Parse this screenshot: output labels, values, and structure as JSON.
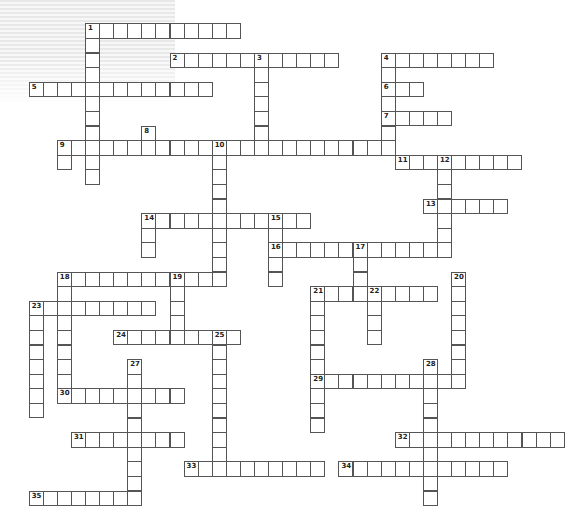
{
  "puzzle": {
    "type": "crossword",
    "grid_origin": {
      "x": 85,
      "y": 23.3
    },
    "cell_w": 14.08,
    "cell_h": 14.6,
    "colors": {
      "border": "#555555",
      "cell": "#ffffff",
      "number": "#222222"
    }
  },
  "across": [
    {
      "num": 1,
      "row": 0,
      "col": 0,
      "len": 11
    },
    {
      "num": 2,
      "row": 2,
      "col": 6,
      "len": 12
    },
    {
      "num": 4,
      "row": 2,
      "col": 21,
      "len": 8
    },
    {
      "num": 5,
      "row": 4,
      "col": -4,
      "len": 13
    },
    {
      "num": 6,
      "row": 4,
      "col": 21,
      "len": 3
    },
    {
      "num": 7,
      "row": 6,
      "col": 21,
      "len": 5
    },
    {
      "num": 9,
      "row": 8,
      "col": -2,
      "len": 24
    },
    {
      "num": 11,
      "row": 9,
      "col": 22,
      "len": 9
    },
    {
      "num": 13,
      "row": 12,
      "col": 24,
      "len": 6
    },
    {
      "num": 14,
      "row": 13,
      "col": 4,
      "len": 12
    },
    {
      "num": 16,
      "row": 15,
      "col": 13,
      "len": 13
    },
    {
      "num": 18,
      "row": 17,
      "col": -2,
      "len": 12
    },
    {
      "num": 21,
      "row": 18,
      "col": 16,
      "len": 9
    },
    {
      "num": 23,
      "row": 19,
      "col": -4,
      "len": 9
    },
    {
      "num": 24,
      "row": 21,
      "col": 2,
      "len": 9
    },
    {
      "num": 29,
      "row": 24,
      "col": 16,
      "len": 11
    },
    {
      "num": 30,
      "row": 25,
      "col": -2,
      "len": 9
    },
    {
      "num": 31,
      "row": 28,
      "col": -1,
      "len": 8
    },
    {
      "num": 32,
      "row": 28,
      "col": 22,
      "len": 12
    },
    {
      "num": 33,
      "row": 30,
      "col": 7,
      "len": 10
    },
    {
      "num": 34,
      "row": 30,
      "col": 18,
      "len": 12
    },
    {
      "num": 35,
      "row": 32,
      "col": -4,
      "len": 8
    }
  ],
  "down": [
    {
      "num": 1,
      "row": 0,
      "col": 0,
      "len": 11
    },
    {
      "num": 3,
      "row": 2,
      "col": 12,
      "len": 7
    },
    {
      "num": 4,
      "row": 2,
      "col": 21,
      "len": 7
    },
    {
      "num": 8,
      "row": 7,
      "col": 4,
      "len": 2
    },
    {
      "num": 9,
      "row": 8,
      "col": -2,
      "len": 2
    },
    {
      "num": 10,
      "row": 8,
      "col": 9,
      "len": 10
    },
    {
      "num": 12,
      "row": 9,
      "col": 25,
      "len": 7
    },
    {
      "num": 14,
      "row": 13,
      "col": 4,
      "len": 3
    },
    {
      "num": 15,
      "row": 13,
      "col": 13,
      "len": 5
    },
    {
      "num": 17,
      "row": 15,
      "col": 19,
      "len": 4
    },
    {
      "num": 18,
      "row": 17,
      "col": -2,
      "len": 9
    },
    {
      "num": 19,
      "row": 17,
      "col": 6,
      "len": 5
    },
    {
      "num": 20,
      "row": 17,
      "col": 26,
      "len": 8
    },
    {
      "num": 21,
      "row": 18,
      "col": 16,
      "len": 10
    },
    {
      "num": 22,
      "row": 18,
      "col": 20,
      "len": 4
    },
    {
      "num": 23,
      "row": 19,
      "col": -4,
      "len": 8
    },
    {
      "num": 25,
      "row": 21,
      "col": 9,
      "len": 10
    },
    {
      "num": 27,
      "row": 23,
      "col": 3,
      "len": 10
    },
    {
      "num": 28,
      "row": 23,
      "col": 24,
      "len": 10
    }
  ]
}
